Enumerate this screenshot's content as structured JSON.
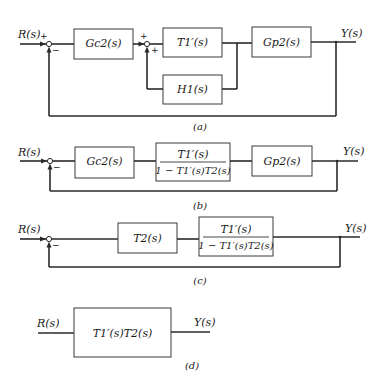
{
  "diagrams": {
    "a": {
      "caption": "(a)",
      "input": "R(s)",
      "output": "Y(s)",
      "sum1": {
        "top_sign": "+",
        "bottom_sign": "−"
      },
      "sum2": {
        "top_sign": "+",
        "bottom_sign": "+"
      },
      "blocks": {
        "controller": "Gc2(s)",
        "inner_forward": "T1′(s)",
        "plant": "Gp2(s)",
        "inner_feedback": "H1(s)"
      }
    },
    "b": {
      "caption": "(b)",
      "input": "R(s)",
      "output": "Y(s)",
      "sum1": {
        "bottom_sign": "−"
      },
      "blocks": {
        "controller": "Gc2(s)",
        "fraction_num": "T1′(s)",
        "fraction_den": "1 − T1′(s)T2(s)",
        "plant": "Gp2(s)"
      }
    },
    "c": {
      "caption": "(c)",
      "input": "R(s)",
      "output": "Y(s)",
      "sum1": {
        "bottom_sign": "−"
      },
      "blocks": {
        "t2": "T2(s)",
        "fraction_num": "T1′(s)",
        "fraction_den": "1 − T1′(s)T2(s)"
      }
    },
    "d": {
      "caption": "(d)",
      "input": "R(s)",
      "output": "Y(s)",
      "blocks": {
        "overall": "T1′(s)T2(s)"
      }
    }
  }
}
